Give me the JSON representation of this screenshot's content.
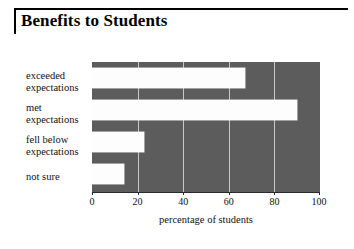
{
  "title": "Benefits to Students",
  "chart_data": {
    "type": "bar",
    "orientation": "horizontal",
    "title": "Benefits to Students",
    "categories": [
      "exceeded expectations",
      "met expectations",
      "fell below expectations",
      "not sure"
    ],
    "category_lines": [
      [
        "exceeded",
        "expectations"
      ],
      [
        "met",
        "expectations"
      ],
      [
        "fell below",
        "expectations"
      ],
      [
        "not sure",
        ""
      ]
    ],
    "values": [
      67,
      90,
      23,
      14
    ],
    "xlabel": "percentage of students",
    "ylabel": "",
    "xlim": [
      0,
      100
    ],
    "xticks": [
      0,
      20,
      40,
      60,
      80,
      100
    ],
    "xtick_labels": [
      "0",
      "20",
      "40",
      "60",
      "80",
      "100"
    ],
    "grid": true,
    "legend": false,
    "colors": {
      "plot_background": "#5c5c5c",
      "bar_fill": "#fdfdfd",
      "gridline": "#c9c9c9",
      "axis": "#2a2a2a",
      "text": "#111111",
      "page_background": "#ffffff"
    }
  }
}
